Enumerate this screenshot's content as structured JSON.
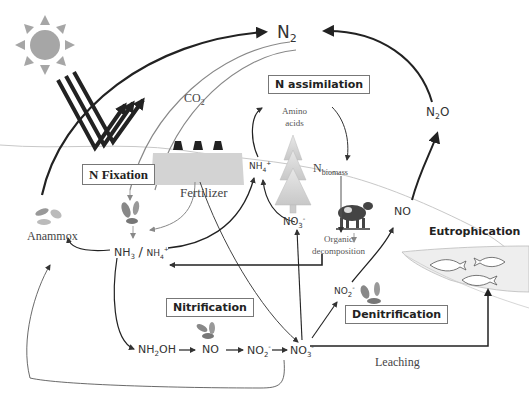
{
  "diagram": {
    "processes": {
      "n_fixation": "N Fixation",
      "n_assimilation": "N assimilation",
      "nitrification": "Nitrification",
      "denitrification": "Denitrification",
      "eutrophication": "Eutrophication"
    },
    "labels": {
      "n2": "N",
      "n2_sub": "2",
      "n2o_pre": "N",
      "n2o_sub": "2",
      "n2o_post": "O",
      "co2": "CO",
      "co2_sub": "2",
      "fertilizer": "Fertilizer",
      "amino_acids_1": "Amino",
      "amino_acids_2": "acids",
      "nbiomass": "N",
      "nbiomass_sub": "biomass",
      "organic_1": "Organic",
      "organic_2": "decomposition",
      "anammox": "Anammox",
      "nh3": "NH",
      "nh3_sub": "3",
      "slash": "/",
      "nh4": "NH",
      "nh4_sub": "4",
      "nh4_sup": "+",
      "nh4_upper": "NH",
      "nh4_upper_sub": "4",
      "nh4_upper_sup": "+",
      "no3_upper": "NO",
      "no3_upper_sub": "3",
      "no3_upper_sup": "-",
      "no_right": "NO",
      "no2_denit": "NO",
      "no2_denit_sub": "2",
      "no2_denit_sup": "-",
      "nh2oh": "NH",
      "nh2oh_sub": "2",
      "nh2oh_post": "OH",
      "no_mid": "NO",
      "no2_mid": "NO",
      "no2_mid_sub": "2",
      "no2_mid_sup": "-",
      "no3_bottom": "NO",
      "no3_bottom_sub": "3",
      "no3_bottom_sup": "-",
      "leaching": "Leaching"
    },
    "icons": [
      "sun-icon",
      "sunlight-rays-icon",
      "tree-icon",
      "cow-icon",
      "bacteria-icon",
      "fish-icon",
      "factory-icon",
      "water-body-icon"
    ],
    "colors": {
      "arrow_dark": "#222222",
      "arrow_grey": "#888888",
      "sun": "#a6a6a6",
      "factory": "#d0d0d0",
      "tree": "#d8d8d8",
      "water": "#eeeeee",
      "ground_line": "#c8c8c8"
    }
  }
}
